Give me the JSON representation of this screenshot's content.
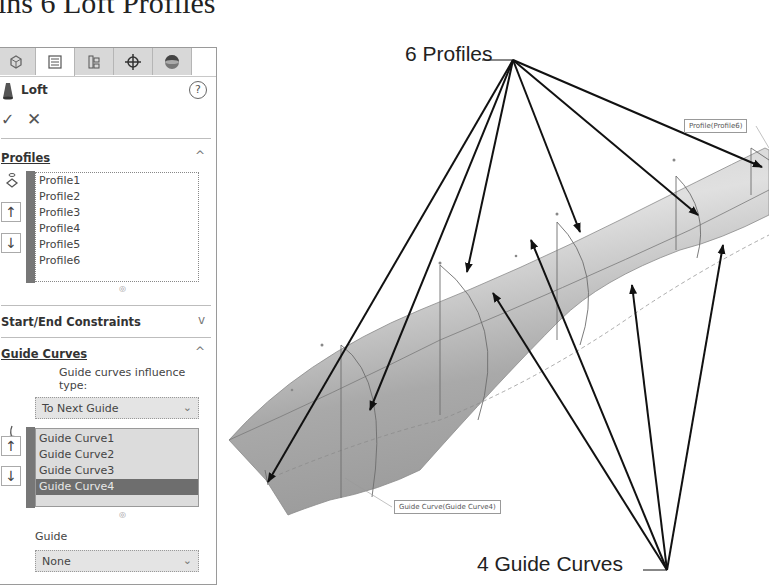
{
  "page_title": "ins 6 Loft Profiles",
  "property_manager": {
    "tabs": [
      {
        "name": "feature-manager",
        "icon": "feature-tree-icon",
        "active": false
      },
      {
        "name": "property-manager",
        "icon": "property-list-icon",
        "active": true
      },
      {
        "name": "configuration-manager",
        "icon": "configuration-icon",
        "active": false
      },
      {
        "name": "dimxpert-manager",
        "icon": "crosshair-icon",
        "active": false
      },
      {
        "name": "display-manager",
        "icon": "appearance-sphere-icon",
        "active": false
      }
    ],
    "feature": {
      "name": "Loft",
      "help": "?"
    },
    "ok": "✓",
    "cancel": "✕",
    "profiles": {
      "title": "Profiles",
      "expanded_chevron": "^",
      "items": [
        "Profile1",
        "Profile2",
        "Profile3",
        "Profile4",
        "Profile5",
        "Profile6"
      ],
      "move_up": "↑",
      "move_down": "↓"
    },
    "start_end_constraints": {
      "title": "Start/End Constraints",
      "chevron": "v"
    },
    "guide_curves": {
      "title": "Guide Curves",
      "expanded_chevron": "^",
      "influence_label": "Guide curves influence type:",
      "influence_value": "To Next Guide",
      "items": [
        "Guide Curve1",
        "Guide Curve2",
        "Guide Curve3",
        "Guide Curve4"
      ],
      "selected_index": 3,
      "move_up": "↑",
      "move_down": "↓",
      "guide_label": "Guide",
      "guide_value": "None"
    }
  },
  "viewport": {
    "callouts": {
      "profiles": "6 Profiles",
      "guide_curves": "4 Guide Curves"
    },
    "tags": {
      "profile": "Profile(Profile6)",
      "guide_curve": "Guide Curve(Guide Curve4)"
    },
    "colors": {
      "surface": "#b4b4b4",
      "edge": "#707070",
      "arrow": "#111111"
    }
  }
}
